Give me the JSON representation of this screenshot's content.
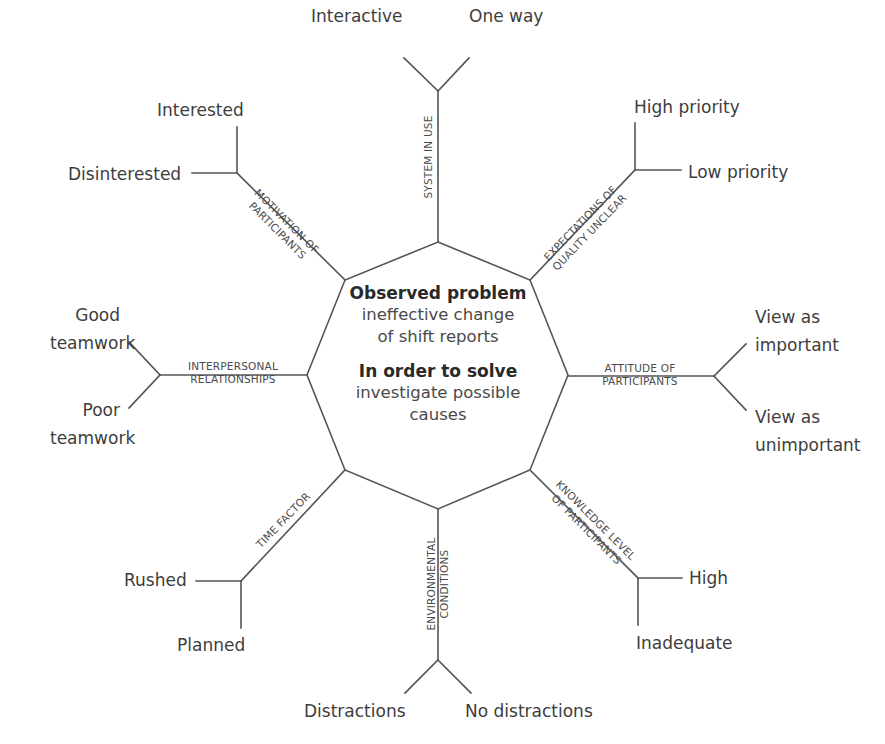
{
  "center": {
    "problem_title": "Observed problem",
    "problem_line1": "ineffective change",
    "problem_line2": "of shift reports",
    "solve_title": "In order to solve",
    "solve_line1": "investigate possible",
    "solve_line2": "causes"
  },
  "branches": {
    "system": {
      "category": "SYSTEM IN USE",
      "options": [
        "Interactive",
        "One way"
      ]
    },
    "expectations": {
      "category_line1": "EXPECTATIONS OF",
      "category_line2": "QUALITY UNCLEAR",
      "options": [
        "High priority",
        "Low priority"
      ]
    },
    "attitude": {
      "category_line1": "ATTITUDE OF",
      "category_line2": "PARTICIPANTS",
      "options": [
        "View as important",
        "View as unimportant"
      ],
      "option_lines": [
        [
          "View as",
          "important"
        ],
        [
          "View as",
          "unimportant"
        ]
      ]
    },
    "knowledge": {
      "category_line1": "KNOWLEDGE LEVEL",
      "category_line2": "OF PARTICIPANTS",
      "options": [
        "High",
        "Inadequate"
      ]
    },
    "environment": {
      "category_line1": "ENVIRONMENTAL",
      "category_line2": "CONDITIONS",
      "options": [
        "Distractions",
        "No distractions"
      ]
    },
    "time": {
      "category": "TIME FACTOR",
      "options": [
        "Rushed",
        "Planned"
      ]
    },
    "interpersonal": {
      "category_line1": "INTERPERSONAL",
      "category_line2": "RELATIONSHIPS",
      "options": [
        "Good teamwork",
        "Poor teamwork"
      ],
      "option_lines": [
        [
          "Good",
          "teamwork"
        ],
        [
          "Poor",
          "teamwork"
        ]
      ]
    },
    "motivation": {
      "category_line1": "MOTIVATION OF",
      "category_line2": "PARTICIPANTS",
      "options": [
        "Interested",
        "Disinterested"
      ]
    }
  },
  "colors": {
    "line": "#555555",
    "text": "#3d3d3d",
    "background": "#ffffff"
  }
}
